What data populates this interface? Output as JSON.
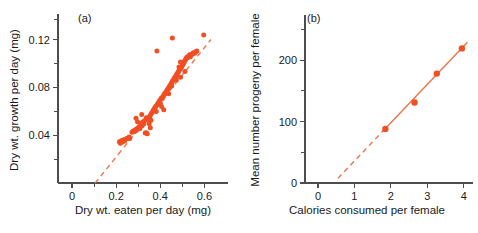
{
  "figure": {
    "background_color": "#ffffff",
    "marker_color": "#f04e23",
    "line_color": "#f0734a",
    "axis_color": "#4d4d4d"
  },
  "chart_data": [
    {
      "type": "scatter",
      "panel": "(a)",
      "title": "",
      "xlabel": "Dry wt. eaten per day (mg)",
      "ylabel": "Dry wt. growth per day (mg)",
      "xlim": [
        0,
        0.68
      ],
      "ylim": [
        0,
        0.138
      ],
      "grid": false,
      "legend": "none",
      "xticks_major": [
        0,
        0.2,
        0.4,
        0.6
      ],
      "xticklabels": [
        "0",
        "0.2",
        "0.4",
        "0.6"
      ],
      "xticks_minor": [
        0.1,
        0.3,
        0.5
      ],
      "yticks_major": [
        0.04,
        0.08,
        0.12
      ],
      "yticklabels": [
        "0.04",
        "0.08",
        "0.12"
      ],
      "yticks_minor": [
        0.02,
        0.06,
        0.1
      ],
      "fit_line": {
        "x_solid": [
          0.21,
          0.63
        ],
        "x_dashed": [
          0.105,
          0.21
        ],
        "slope": 0.2286,
        "intercept": -0.024
      },
      "points": [
        [
          0.215,
          0.0345
        ],
        [
          0.219,
          0.0333
        ],
        [
          0.222,
          0.0352
        ],
        [
          0.224,
          0.0338
        ],
        [
          0.228,
          0.0356
        ],
        [
          0.231,
          0.0347
        ],
        [
          0.235,
          0.0362
        ],
        [
          0.238,
          0.0351
        ],
        [
          0.246,
          0.037
        ],
        [
          0.252,
          0.0374
        ],
        [
          0.272,
          0.0424
        ],
        [
          0.276,
          0.0432
        ],
        [
          0.28,
          0.0428
        ],
        [
          0.284,
          0.0441
        ],
        [
          0.288,
          0.0435
        ],
        [
          0.292,
          0.0452
        ],
        [
          0.296,
          0.0447
        ],
        [
          0.3,
          0.0462
        ],
        [
          0.305,
          0.047
        ],
        [
          0.308,
          0.0456
        ],
        [
          0.312,
          0.0488
        ],
        [
          0.316,
          0.0501
        ],
        [
          0.318,
          0.0478
        ],
        [
          0.322,
          0.0512
        ],
        [
          0.326,
          0.0495
        ],
        [
          0.33,
          0.0523
        ],
        [
          0.332,
          0.0418
        ],
        [
          0.337,
          0.042
        ],
        [
          0.341,
          0.0412
        ],
        [
          0.346,
          0.053
        ],
        [
          0.349,
          0.0545
        ],
        [
          0.352,
          0.0556
        ],
        [
          0.356,
          0.0568
        ],
        [
          0.358,
          0.0524
        ],
        [
          0.361,
          0.0585
        ],
        [
          0.364,
          0.0592
        ],
        [
          0.368,
          0.0604
        ],
        [
          0.37,
          0.0612
        ],
        [
          0.374,
          0.0623
        ],
        [
          0.377,
          0.0631
        ],
        [
          0.38,
          0.0642
        ],
        [
          0.382,
          0.0597
        ],
        [
          0.386,
          0.0655
        ],
        [
          0.389,
          0.0663
        ],
        [
          0.392,
          0.0672
        ],
        [
          0.395,
          0.0681
        ],
        [
          0.398,
          0.069
        ],
        [
          0.4,
          0.0668
        ],
        [
          0.403,
          0.0702
        ],
        [
          0.406,
          0.0712
        ],
        [
          0.409,
          0.0706
        ],
        [
          0.413,
          0.0722
        ],
        [
          0.416,
          0.0735
        ],
        [
          0.419,
          0.0744
        ],
        [
          0.422,
          0.0751
        ],
        [
          0.426,
          0.0762
        ],
        [
          0.43,
          0.0774
        ],
        [
          0.433,
          0.0783
        ],
        [
          0.436,
          0.079
        ],
        [
          0.44,
          0.0801
        ],
        [
          0.443,
          0.0812
        ],
        [
          0.446,
          0.082
        ],
        [
          0.45,
          0.0832
        ],
        [
          0.453,
          0.0845
        ],
        [
          0.456,
          0.0854
        ],
        [
          0.46,
          0.0862
        ],
        [
          0.463,
          0.0873
        ],
        [
          0.466,
          0.0882
        ],
        [
          0.47,
          0.0893
        ],
        [
          0.473,
          0.0902
        ],
        [
          0.476,
          0.0914
        ],
        [
          0.48,
          0.0925
        ],
        [
          0.483,
          0.0933
        ],
        [
          0.486,
          0.0944
        ],
        [
          0.49,
          0.0952
        ],
        [
          0.492,
          0.0884
        ],
        [
          0.494,
          0.0962
        ],
        [
          0.497,
          0.0972
        ],
        [
          0.5,
          0.0983
        ],
        [
          0.503,
          0.0992
        ],
        [
          0.506,
          0.1003
        ],
        [
          0.509,
          0.1012
        ],
        [
          0.512,
          0.1024
        ],
        [
          0.515,
          0.1032
        ],
        [
          0.518,
          0.1043
        ],
        [
          0.521,
          0.1052
        ],
        [
          0.524,
          0.1048
        ],
        [
          0.527,
          0.1058
        ],
        [
          0.53,
          0.1063
        ],
        [
          0.533,
          0.1072
        ],
        [
          0.536,
          0.1055
        ],
        [
          0.539,
          0.1068
        ],
        [
          0.543,
          0.1076
        ],
        [
          0.547,
          0.1082
        ],
        [
          0.55,
          0.109
        ],
        [
          0.556,
          0.1085
        ],
        [
          0.561,
          0.1098
        ],
        [
          0.566,
          0.1105
        ],
        [
          0.455,
          0.1213
        ],
        [
          0.485,
          0.097
        ],
        [
          0.512,
          0.0932
        ],
        [
          0.597,
          0.1237
        ],
        [
          0.385,
          0.1105
        ],
        [
          0.35,
          0.0495
        ],
        [
          0.355,
          0.0463
        ],
        [
          0.337,
          0.0545
        ],
        [
          0.316,
          0.0573
        ],
        [
          0.297,
          0.0512
        ],
        [
          0.29,
          0.0541
        ],
        [
          0.406,
          0.064
        ],
        [
          0.416,
          0.0612
        ],
        [
          0.438,
          0.0746
        ],
        [
          0.452,
          0.0812
        ],
        [
          0.473,
          0.0862
        ],
        [
          0.492,
          0.1012
        ],
        [
          0.259,
          0.0385
        ],
        [
          0.262,
          0.0372
        ]
      ]
    },
    {
      "type": "scatter",
      "panel": "(b)",
      "title": "",
      "xlabel": "Calories consumed per female",
      "ylabel": "Mean number progeny per female",
      "xlim": [
        0,
        4.2
      ],
      "ylim": [
        0,
        262
      ],
      "grid": false,
      "legend": "none",
      "xticks_major": [
        0,
        1,
        2,
        3,
        4
      ],
      "xticklabels": [
        "0",
        "1",
        "2",
        "3",
        "4"
      ],
      "yticks_major": [
        0,
        100,
        200
      ],
      "yticklabels": [
        "0",
        "100",
        "200"
      ],
      "yticks_minor": [
        50,
        150,
        250
      ],
      "fit_line": {
        "x_solid": [
          1.85,
          4.1
        ],
        "x_dashed": [
          0.55,
          1.85
        ],
        "slope": 62.3,
        "intercept": -26.5
      },
      "points": [
        [
          1.85,
          88
        ],
        [
          2.65,
          131
        ],
        [
          3.26,
          178
        ],
        [
          3.95,
          219
        ]
      ]
    }
  ]
}
